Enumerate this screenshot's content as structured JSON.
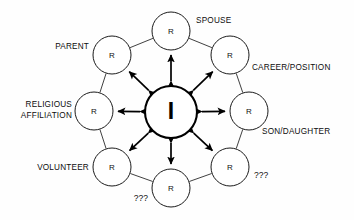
{
  "diagram": {
    "center": {
      "label": "I",
      "name": "self-node",
      "cx": 171,
      "cy": 112,
      "r": 26
    },
    "node_letter": "R",
    "colors": {
      "stroke": "#1b1b1b",
      "center_stroke": "#000000",
      "arrow": "#000000",
      "text": "#0d0d0d",
      "background": "#ffffff"
    },
    "nodes": [
      {
        "id": "spouse",
        "letter": "R",
        "label": "SPOUSE",
        "cx": 171,
        "cy": 31,
        "r": 19,
        "label_x": 196,
        "label_y": 23,
        "label_anchor": "start",
        "lines": [
          "SPOUSE"
        ]
      },
      {
        "id": "career-position",
        "letter": "R",
        "label": "CAREER/POSITION",
        "cx": 230,
        "cy": 55,
        "r": 19,
        "label_x": 252,
        "label_y": 70,
        "label_anchor": "start",
        "lines": [
          "CAREER/POSITION"
        ]
      },
      {
        "id": "son-daughter",
        "letter": "R",
        "label": "SON/DAUGHTER",
        "cx": 249,
        "cy": 111,
        "r": 19,
        "label_x": 262,
        "label_y": 134,
        "label_anchor": "start",
        "lines": [
          "SON/DAUGHTER"
        ]
      },
      {
        "id": "unknown-right",
        "letter": "R",
        "label": "???",
        "cx": 230,
        "cy": 167,
        "r": 19,
        "label_x": 254,
        "label_y": 178,
        "label_anchor": "start",
        "lines": [
          "???"
        ]
      },
      {
        "id": "unknown-bottom",
        "letter": "R",
        "label": "???",
        "cx": 171,
        "cy": 188,
        "r": 19,
        "label_x": 148,
        "label_y": 201,
        "label_anchor": "end",
        "lines": [
          "???"
        ]
      },
      {
        "id": "volunteer",
        "letter": "R",
        "label": "VOLUNTEER",
        "cx": 112,
        "cy": 167,
        "r": 19,
        "label_x": 89,
        "label_y": 170,
        "label_anchor": "end",
        "lines": [
          "VOLUNTEER"
        ]
      },
      {
        "id": "religious-affiliation",
        "letter": "R",
        "label": "RELIGIOUS AFFILIATION",
        "cx": 94,
        "cy": 111,
        "r": 19,
        "label_x": 72,
        "label_y": 107,
        "label_anchor": "end",
        "lines": [
          "RELIGIOUS",
          "AFFILIATION"
        ]
      },
      {
        "id": "parent",
        "letter": "R",
        "label": "PARENT",
        "cx": 112,
        "cy": 55,
        "r": 19,
        "label_x": 89,
        "label_y": 49,
        "label_anchor": "end",
        "lines": [
          "PARENT"
        ]
      }
    ]
  }
}
